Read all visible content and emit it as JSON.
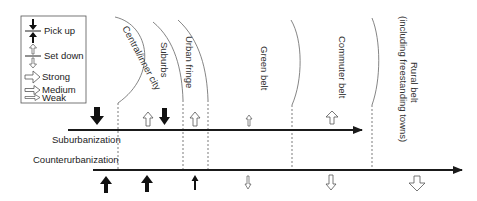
{
  "legend": {
    "items": [
      {
        "icon": "pick-up-icon",
        "label": "Pick up"
      },
      {
        "icon": "set-down-icon",
        "label": "Set down"
      },
      {
        "icon": "strong-arrow-icon",
        "label": "Strong"
      },
      {
        "icon": "medium-arrow-icon",
        "label": "Medium"
      },
      {
        "icon": "weak-arrow-icon",
        "label": "Weak"
      }
    ]
  },
  "zones": [
    {
      "name": "central-inner-city",
      "label": "Central/inner city"
    },
    {
      "name": "suburbs",
      "label": "Suburbs"
    },
    {
      "name": "urban-fringe",
      "label": "Urban fringe"
    },
    {
      "name": "green-belt",
      "label": "Green belt"
    },
    {
      "name": "commuter-belt",
      "label": "Commuter belt"
    },
    {
      "name": "rural-belt",
      "label": "Rural belt",
      "sublabel": "(including freestanding towns)"
    }
  ],
  "processes": [
    {
      "name": "suburbanization",
      "label": "Suburbanization"
    },
    {
      "name": "counterurbanization",
      "label": "Counterurbanization"
    }
  ],
  "colors": {
    "line": "#1a1a1a",
    "outline_arrow": "#555555",
    "dashed": "#444444"
  }
}
